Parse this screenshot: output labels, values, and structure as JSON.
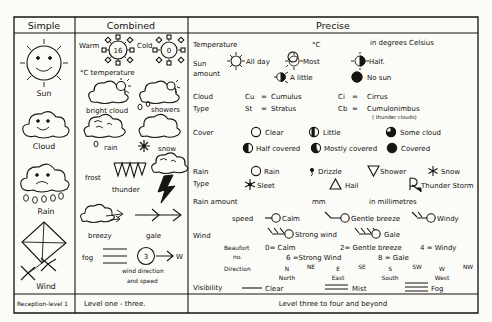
{
  "page": {
    "ink_color": "#17150f",
    "paper_color": "#fbfbf8"
  },
  "columns": {
    "headers": [
      {
        "id": "simple",
        "label": "Simple"
      },
      {
        "id": "combined",
        "label": "Combined"
      },
      {
        "id": "precise",
        "label": "Precise"
      }
    ],
    "footers": [
      {
        "id": "simple",
        "label": "Reception-level 1"
      },
      {
        "id": "combined",
        "label": "Level one - three."
      },
      {
        "id": "precise",
        "label": "Level three to four and beyond"
      }
    ]
  },
  "simple": {
    "items": [
      {
        "name": "sun-face",
        "label": "Sun"
      },
      {
        "name": "cloud-face",
        "label": "Cloud"
      },
      {
        "name": "rain-cloud-face",
        "label": "Rain"
      },
      {
        "name": "kite",
        "label": "Wind"
      }
    ]
  },
  "combined": {
    "temperature": {
      "warm_label": "Warm",
      "warm_value": "16",
      "cold_label": "Cold",
      "cold_value": "0",
      "caption": "°C temperature"
    },
    "items": [
      {
        "name": "bright-cloud",
        "label": "bright cloud"
      },
      {
        "name": "showers",
        "label": "showers"
      },
      {
        "name": "rain",
        "label": "rain"
      },
      {
        "name": "snow",
        "label": "snow"
      },
      {
        "name": "frost",
        "label": "frost"
      },
      {
        "name": "thunder",
        "label": "thunder"
      },
      {
        "name": "breezy",
        "label": "breezy"
      },
      {
        "name": "gale",
        "label": "gale"
      },
      {
        "name": "fog",
        "label": "fog"
      }
    ],
    "wind_dial": {
      "value": "3",
      "direction": "W",
      "caption_line1": "wind direction",
      "caption_line2": "and speed"
    }
  },
  "precise": {
    "rows": [
      {
        "id": "temperature",
        "label": "Temperature",
        "unit": "°C",
        "note": "in degrees Celsius"
      },
      {
        "id": "sun-amount",
        "label_line1": "Sun",
        "label_line2": "amount",
        "options": [
          {
            "symbol": "sun-all-day",
            "label": "All day"
          },
          {
            "symbol": "sun-most",
            "label": "Most"
          },
          {
            "symbol": "sun-half",
            "label": "Half."
          },
          {
            "symbol": "sun-a-little",
            "label": "A little"
          },
          {
            "symbol": "sun-none",
            "label": "No sun"
          }
        ]
      },
      {
        "id": "cloud-type",
        "label_line1": "Cloud",
        "label_line2": "Type",
        "entries": [
          {
            "abbr": "Cu",
            "eq": "=",
            "name": "Cumulus"
          },
          {
            "abbr": "Ci",
            "eq": "=",
            "name": "Cirrus"
          },
          {
            "abbr": "St",
            "eq": "=",
            "name": "Stratus"
          },
          {
            "abbr": "Cb",
            "eq": "=",
            "name": "Cumulonimbus",
            "note": "( thunder clouds)"
          }
        ]
      },
      {
        "id": "cover",
        "label": "Cover",
        "options": [
          {
            "symbol": "circle-empty",
            "label": "Clear"
          },
          {
            "symbol": "circle-quarter-left",
            "label": "Little"
          },
          {
            "symbol": "circle-three-quarter",
            "label": "Some cloud"
          },
          {
            "symbol": "circle-half",
            "label": "Half covered"
          },
          {
            "symbol": "circle-mostly",
            "label": "Mostly covered"
          },
          {
            "symbol": "circle-full",
            "label": "Covered"
          }
        ]
      },
      {
        "id": "rain-type",
        "label_line1": "Rain",
        "label_line2": "Type",
        "options": [
          {
            "symbol": "circle-rain",
            "label": "Rain"
          },
          {
            "symbol": "comma-drizzle",
            "label": "Drizzle"
          },
          {
            "symbol": "triangle-down",
            "label": "Shower"
          },
          {
            "symbol": "asterisk-snow",
            "label": "Snow"
          },
          {
            "symbol": "sleet-star",
            "label": "Sleet"
          },
          {
            "symbol": "triangle-hail",
            "label": "Hail"
          },
          {
            "symbol": "r-thunder",
            "label": "Thunder Storm"
          }
        ]
      },
      {
        "id": "rain-amount",
        "label": "Rain amount",
        "unit": "mm",
        "note": "in millimetres"
      },
      {
        "id": "wind",
        "label": "Wind",
        "speed_label": "speed",
        "speed_options": [
          {
            "barbs": 0,
            "label": "Calm"
          },
          {
            "barbs": 1,
            "label": "Gentle breeze"
          },
          {
            "barbs": 2,
            "label": "Windy"
          },
          {
            "barbs": 3,
            "label": "Strong wind"
          },
          {
            "barbs": 4,
            "label": "Gale"
          }
        ],
        "beaufort_label_line1": "Beaufort",
        "beaufort_label_line2": "no.",
        "beaufort": [
          "0= Calm",
          "2= Gentle breeze",
          "4 = Windy",
          "6 =Strong Wind",
          "8 = Gale"
        ],
        "direction_label": "Direction",
        "directions": [
          {
            "abbr": "N",
            "name": "North"
          },
          {
            "abbr": "NE",
            "name": ""
          },
          {
            "abbr": "E",
            "name": "East"
          },
          {
            "abbr": "SE",
            "name": ""
          },
          {
            "abbr": "S",
            "name": "South"
          },
          {
            "abbr": "SW",
            "name": ""
          },
          {
            "abbr": "W",
            "name": "West"
          },
          {
            "abbr": "NW",
            "name": ""
          }
        ]
      },
      {
        "id": "visibility",
        "label": "Visibility",
        "options": [
          {
            "symbol": "single-line",
            "label": "Clear"
          },
          {
            "symbol": "double-line",
            "label": "Mist"
          },
          {
            "symbol": "triple-line",
            "label": "Fog"
          }
        ]
      }
    ]
  }
}
